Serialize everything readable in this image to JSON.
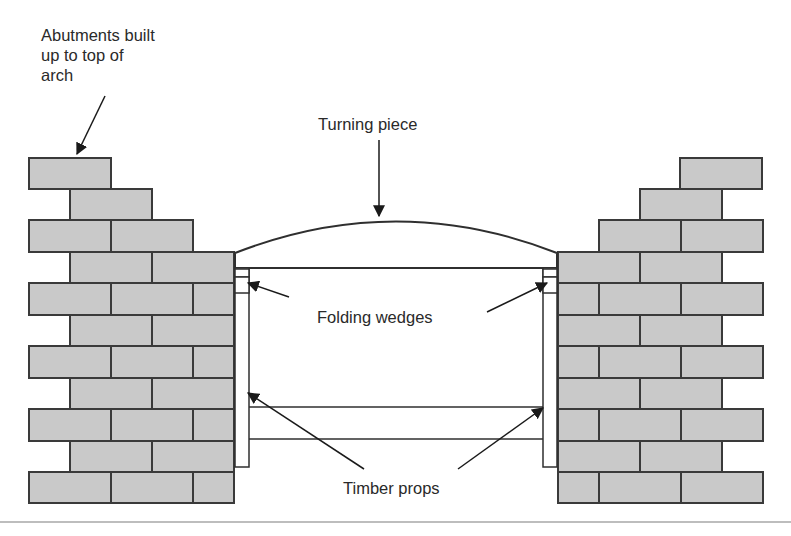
{
  "diagram": {
    "type": "construction-detail",
    "colors": {
      "brick_fill": "#c9c9c9",
      "brick_stroke": "#3a3a3a",
      "timber_fill": "#ffffff",
      "line": "#2f2f2f",
      "text": "#2a2a2a",
      "rule": "#bdbdbd"
    },
    "labels": {
      "abutments": "Abutments built\nup to top of\narch",
      "turning_piece": "Turning piece",
      "folding_wedges": "Folding wedges",
      "timber_props": "Timber props"
    },
    "components": [
      {
        "id": "left-abutment",
        "label": "Abutments built up to top of arch"
      },
      {
        "id": "right-abutment"
      },
      {
        "id": "turning-piece",
        "label": "Turning piece"
      },
      {
        "id": "folding-wedges",
        "label": "Folding wedges",
        "count": 2
      },
      {
        "id": "timber-props",
        "label": "Timber props",
        "count": 2
      },
      {
        "id": "cross-brace"
      }
    ]
  }
}
